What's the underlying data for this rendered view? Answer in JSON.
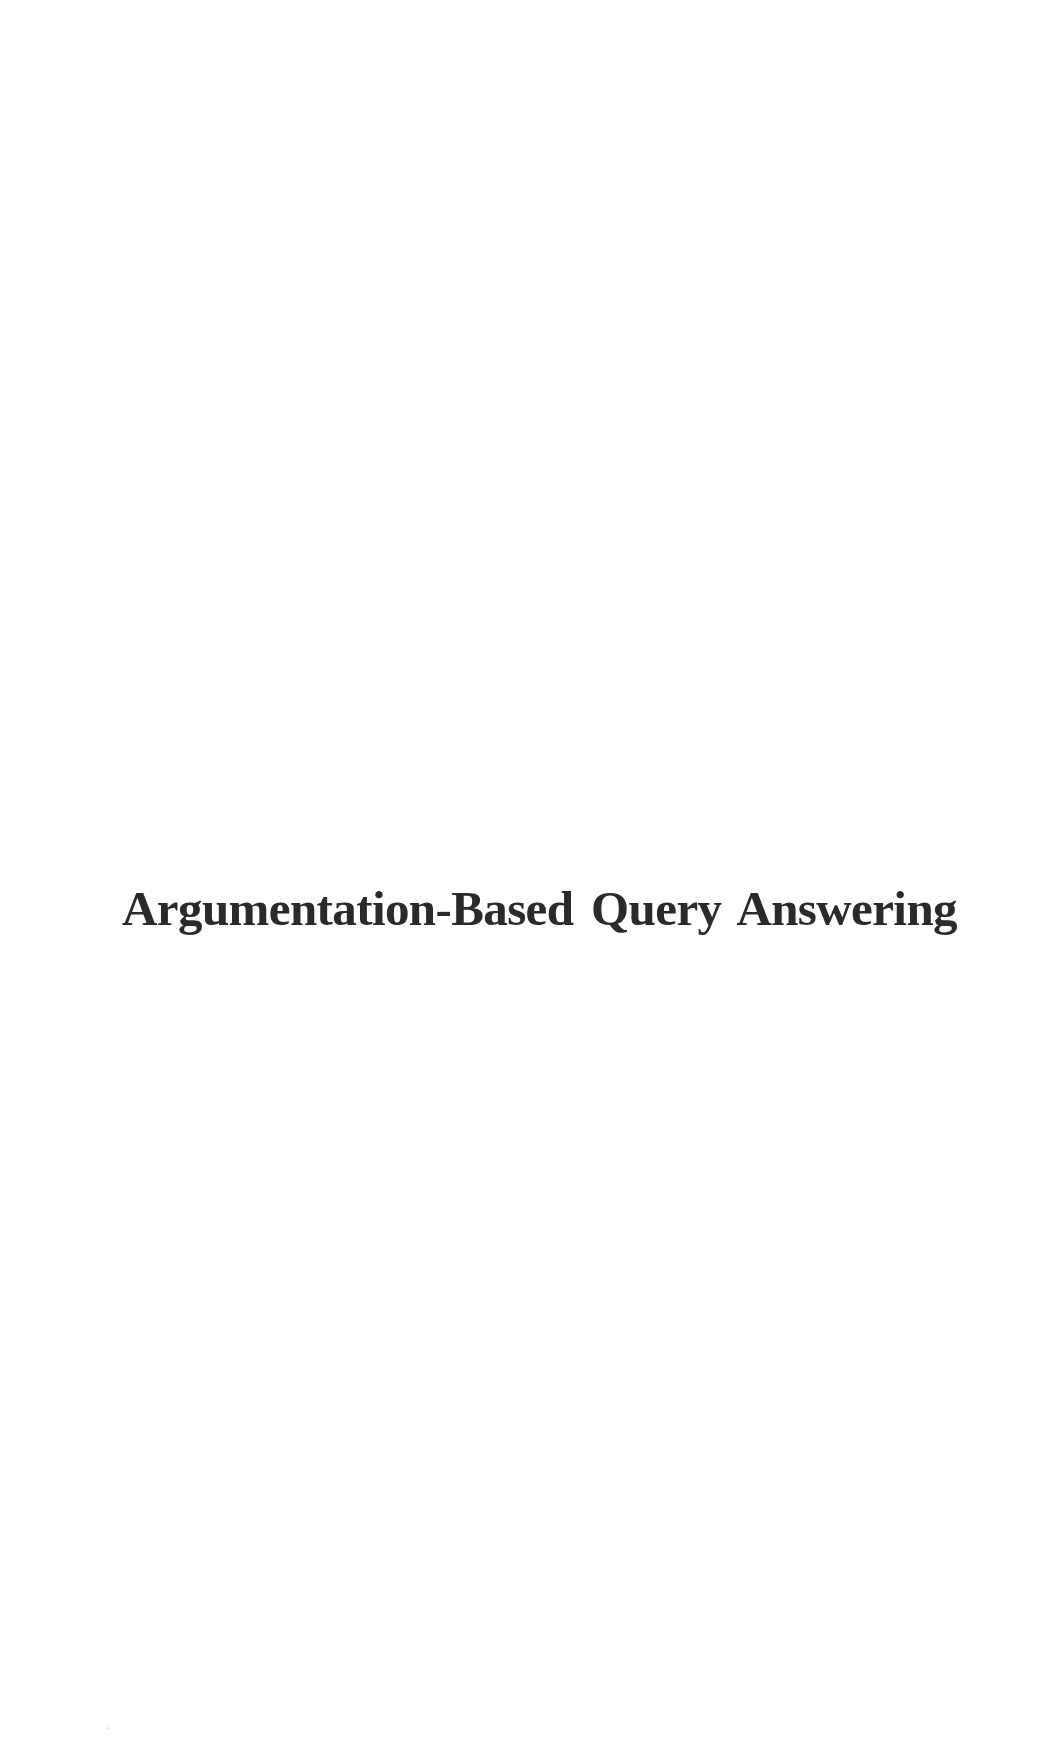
{
  "page": {
    "type": "half-title page",
    "title": "Argumentation-Based Query Answering"
  }
}
